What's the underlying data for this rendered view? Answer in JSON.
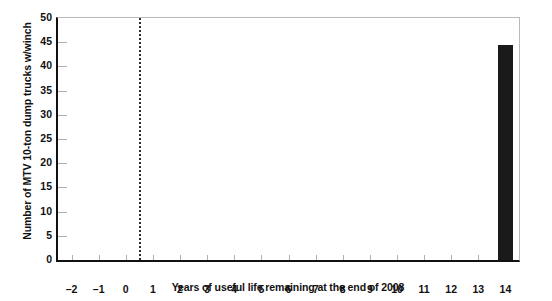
{
  "chart_data": {
    "type": "bar",
    "title": "",
    "subtitle": "",
    "xlabel": "Years of useful life remaining at the end of 2008",
    "ylabel": "Number of MTV 10-ton dump trucks w/winch",
    "categories": [
      "-2",
      "-1",
      "0",
      "1",
      "2",
      "3",
      "4",
      "5",
      "6",
      "7",
      "8",
      "9",
      "10",
      "11",
      "12",
      "13",
      "14"
    ],
    "x": [
      -2,
      -1,
      0,
      1,
      2,
      3,
      4,
      5,
      6,
      7,
      8,
      9,
      10,
      11,
      12,
      13,
      14
    ],
    "values": [
      0,
      0,
      0,
      0,
      0,
      0,
      0,
      0,
      0,
      0,
      0,
      0,
      0,
      0,
      0,
      0,
      44.5
    ],
    "xlim": [
      -2.5,
      14.5
    ],
    "ylim": [
      0,
      50
    ],
    "ytick_labels": [
      "0",
      "5",
      "10",
      "15",
      "20",
      "25",
      "30",
      "35",
      "40",
      "45",
      "50"
    ],
    "yticks": [
      0,
      5,
      10,
      15,
      20,
      25,
      30,
      35,
      40,
      45,
      50
    ],
    "xtick_labels": [
      "-2",
      "-1",
      "0",
      "1",
      "2",
      "3",
      "4",
      "5",
      "6",
      "7",
      "8",
      "9",
      "10",
      "11",
      "12",
      "13",
      "14"
    ],
    "grid": false,
    "legend": null,
    "bar_color": "#1a1a1a",
    "bar_width": 0.55,
    "annotations": [
      {
        "name": "reference-line",
        "type": "vertical-dotted-line",
        "x": 0.5,
        "color": "#2b2b2b",
        "label": ""
      }
    ]
  }
}
